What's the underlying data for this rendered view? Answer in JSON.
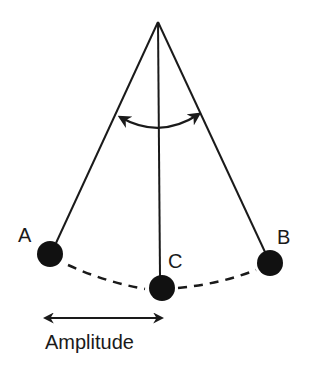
{
  "diagram": {
    "colors": {
      "stroke": "#1a1a1a",
      "bob": "#111111",
      "background": "#ffffff"
    },
    "pivot": {
      "x": 158,
      "y": 22
    },
    "bobs": [
      {
        "id": "A",
        "label": "A",
        "cx": 50,
        "cy": 254,
        "r": 13,
        "label_x": 18,
        "label_y": 242
      },
      {
        "id": "C",
        "label": "C",
        "cx": 162,
        "cy": 288,
        "r": 13,
        "label_x": 168,
        "label_y": 268
      },
      {
        "id": "B",
        "label": "B",
        "cx": 270,
        "cy": 263,
        "r": 13,
        "label_x": 277,
        "label_y": 244
      }
    ],
    "angle_arrow": {
      "meaning": "angle of swing",
      "from": {
        "x": 118,
        "y": 117
      },
      "to": {
        "x": 200,
        "y": 114
      },
      "control": {
        "x": 160,
        "y": 140
      }
    },
    "path": {
      "style": "dashed",
      "meaning": "arc of swing"
    },
    "amplitude": {
      "label": "Amplitude",
      "arrow_from": {
        "x": 43,
        "y": 318
      },
      "arrow_to": {
        "x": 164,
        "y": 318
      },
      "label_x": 45,
      "label_y": 349
    }
  }
}
